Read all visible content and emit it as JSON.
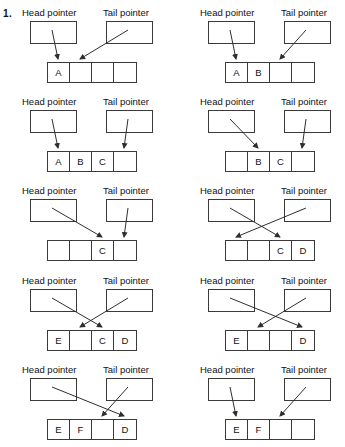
{
  "figure": {
    "item_number": "1.",
    "head_label": "Head pointer",
    "tail_label": "Tail pointer",
    "type": "circular-queue-diagram",
    "cell_count": 4,
    "panel_count": 10,
    "columns": 2,
    "rows": 5,
    "stroke_color": "#2e2e2e",
    "background_color": "#ffffff"
  },
  "panels": [
    {
      "id": "step-1",
      "column": "left",
      "row": 1,
      "head_label": "Head pointer",
      "tail_label": "Tail pointer",
      "cells": [
        "A",
        "",
        "",
        ""
      ],
      "head_target_cell": 1,
      "tail_target_cell": 2,
      "arrows_cross": false
    },
    {
      "id": "step-2",
      "column": "right",
      "row": 1,
      "head_label": "Head pointer",
      "tail_label": "Tail pointer",
      "cells": [
        "A",
        "B",
        "",
        ""
      ],
      "head_target_cell": 1,
      "tail_target_cell": 3,
      "arrows_cross": false
    },
    {
      "id": "step-3",
      "column": "left",
      "row": 2,
      "head_label": "Head pointer",
      "tail_label": "Tail pointer",
      "cells": [
        "A",
        "B",
        "C",
        ""
      ],
      "head_target_cell": 1,
      "tail_target_cell": 4,
      "arrows_cross": false
    },
    {
      "id": "step-4",
      "column": "right",
      "row": 2,
      "head_label": "Head pointer",
      "tail_label": "Tail pointer",
      "cells": [
        "",
        "B",
        "C",
        ""
      ],
      "head_target_cell": 2,
      "tail_target_cell": 4,
      "arrows_cross": false
    },
    {
      "id": "step-5",
      "column": "left",
      "row": 3,
      "head_label": "Head pointer",
      "tail_label": "Tail pointer",
      "cells": [
        "",
        "",
        "C",
        ""
      ],
      "head_target_cell": 3,
      "tail_target_cell": 4,
      "arrows_cross": false
    },
    {
      "id": "step-6",
      "column": "right",
      "row": 3,
      "head_label": "Head pointer",
      "tail_label": "Tail pointer",
      "cells": [
        "",
        "",
        "C",
        "D"
      ],
      "head_target_cell": 3,
      "tail_target_cell": 1,
      "arrows_cross": true
    },
    {
      "id": "step-7",
      "column": "left",
      "row": 4,
      "head_label": "Head pointer",
      "tail_label": "Tail pointer",
      "cells": [
        "E",
        "",
        "C",
        "D"
      ],
      "head_target_cell": 3,
      "tail_target_cell": 2,
      "arrows_cross": true
    },
    {
      "id": "step-8",
      "column": "right",
      "row": 4,
      "head_label": "Head pointer",
      "tail_label": "Tail pointer",
      "cells": [
        "E",
        "",
        "",
        "D"
      ],
      "head_target_cell": 4,
      "tail_target_cell": 2,
      "arrows_cross": true
    },
    {
      "id": "step-9",
      "column": "left",
      "row": 5,
      "head_label": "Head pointer",
      "tail_label": "Tail pointer",
      "cells": [
        "E",
        "F",
        "",
        "D"
      ],
      "head_target_cell": 4,
      "tail_target_cell": 3,
      "arrows_cross": true
    },
    {
      "id": "step-10",
      "column": "right",
      "row": 5,
      "head_label": "Head pointer",
      "tail_label": "Tail pointer",
      "cells": [
        "E",
        "F",
        "",
        ""
      ],
      "head_target_cell": 1,
      "tail_target_cell": 3,
      "arrows_cross": false
    }
  ]
}
